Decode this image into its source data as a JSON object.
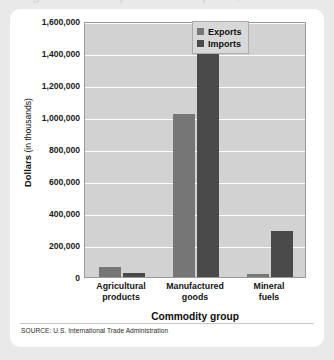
{
  "figure": {
    "cropped_title": "Agricultural Exports and Imports, 2011",
    "source": "SOURCE: U.S. International Trade Administration"
  },
  "legend": {
    "position": "top-right",
    "entries": [
      {
        "label": "Exports",
        "color": "#767676"
      },
      {
        "label": "Imports",
        "color": "#4a4a4a"
      }
    ]
  },
  "axes": {
    "ylabel_strong": "Dollars",
    "ylabel_light": "(in thousands)",
    "xlabel": "Commodity group",
    "yticks": [
      "0",
      "200,000",
      "400,000",
      "600,000",
      "800,000",
      "1,000,000",
      "1,200,000",
      "1,400,000",
      "1,600,000"
    ]
  },
  "chart_data": {
    "type": "bar",
    "title": "Agricultural Exports and Imports, 2011",
    "xlabel": "Commodity group",
    "ylabel": "Dollars (in thousands)",
    "categories": [
      "Agricultural products",
      "Manufactured goods",
      "Mineral fuels"
    ],
    "category_lines": [
      [
        "Agricultural",
        "products"
      ],
      [
        "Manufactured",
        "goods"
      ],
      [
        "Mineral",
        "fuels"
      ]
    ],
    "series": [
      {
        "name": "Exports",
        "color": "#767676",
        "values": [
          60000,
          1020000,
          20000
        ]
      },
      {
        "name": "Imports",
        "color": "#4a4a4a",
        "values": [
          25000,
          1555000,
          290000
        ]
      }
    ],
    "ylim": [
      0,
      1600000
    ],
    "ytick_step": 200000,
    "yticks": [
      0,
      200000,
      400000,
      600000,
      800000,
      1000000,
      1200000,
      1400000,
      1600000
    ],
    "grid": true,
    "legend_position": "top-right",
    "plot_background": "#d2d2d2",
    "gridline_color": "#fdfdfd",
    "source": "SOURCE: U.S. International Trade Administration"
  }
}
